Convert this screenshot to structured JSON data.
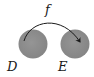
{
  "diagram": {
    "type": "function-mapping",
    "function_label": "f",
    "domain_set": {
      "label": "D",
      "fill": "#8c8c8c"
    },
    "codomain_set": {
      "label": "E",
      "fill": "#8c8c8c"
    },
    "arrow_color": "#1a1a1a",
    "background": "#ffffff"
  }
}
